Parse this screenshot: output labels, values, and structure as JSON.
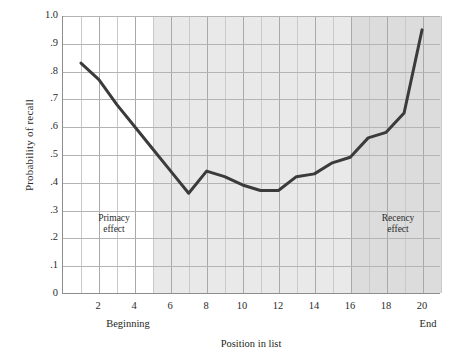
{
  "chart_data": {
    "type": "line",
    "title": "",
    "xlabel": "Position in list",
    "ylabel": "Probability of recall",
    "xlim": [
      0,
      21
    ],
    "ylim": [
      0,
      1.0
    ],
    "grid": true,
    "legend": null,
    "x": [
      1,
      2,
      3,
      4,
      5,
      6,
      7,
      8,
      9,
      10,
      11,
      12,
      13,
      14,
      15,
      16,
      17,
      18,
      19,
      20
    ],
    "values": [
      0.83,
      0.77,
      0.68,
      0.6,
      0.52,
      0.44,
      0.36,
      0.44,
      0.42,
      0.39,
      0.37,
      0.37,
      0.42,
      0.43,
      0.47,
      0.49,
      0.56,
      0.58,
      0.65,
      0.95
    ],
    "xticks": [
      "2",
      "4",
      "6",
      "8",
      "10",
      "12",
      "14",
      "16",
      "18",
      "20"
    ],
    "xtick_values": [
      2,
      4,
      6,
      8,
      10,
      12,
      14,
      16,
      18,
      20
    ],
    "yticks": [
      "0",
      ".1",
      ".2",
      ".3",
      ".4",
      ".5",
      ".6",
      ".7",
      ".8",
      ".9",
      "1.0"
    ],
    "ytick_values": [
      0,
      0.1,
      0.2,
      0.3,
      0.4,
      0.5,
      0.6,
      0.7,
      0.8,
      0.9,
      1.0
    ],
    "annotations": [
      {
        "name": "primacy",
        "text_line1": "Primacy",
        "text_line2": "effect",
        "x_range": [
          1,
          5
        ]
      },
      {
        "name": "recency",
        "text_line1": "Recency",
        "text_line2": "effect",
        "x_range": [
          16,
          21
        ]
      }
    ],
    "axis_end_labels": {
      "left": "Beginning",
      "right": "End"
    },
    "shaded_regions": [
      {
        "name": "primacy-band",
        "from": 0,
        "to": 5,
        "color": "#ffffff"
      },
      {
        "name": "middle-band",
        "from": 5,
        "to": 16,
        "color": "#e9e9e9"
      },
      {
        "name": "recency-band",
        "from": 16,
        "to": 21,
        "color": "#dcdcdc"
      }
    ],
    "line_color": "#3b3b3b",
    "line_width": 3
  }
}
